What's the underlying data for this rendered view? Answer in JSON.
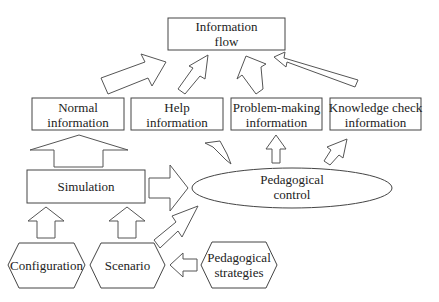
{
  "diagram": {
    "nodes": {
      "information_flow": {
        "line1": "Information",
        "line2": "flow"
      },
      "normal_information": {
        "line1": "Normal",
        "line2": "information"
      },
      "help_information": {
        "line1": "Help",
        "line2": "information"
      },
      "problem_making_information": {
        "line1": "Problem-making",
        "line2": "information"
      },
      "knowledge_check_information": {
        "line1": "Knowledge check",
        "line2": "information"
      },
      "simulation": {
        "label": "Simulation"
      },
      "pedagogical_control": {
        "line1": "Pedagogical",
        "line2": "control"
      },
      "configuration": {
        "label": "Configuration"
      },
      "scenario": {
        "label": "Scenario"
      },
      "pedagogical_strategies": {
        "line1": "Pedagogical",
        "line2": "strategies"
      }
    },
    "edges": [
      {
        "from": "normal_information",
        "to": "information_flow"
      },
      {
        "from": "help_information",
        "to": "information_flow"
      },
      {
        "from": "problem_making_information",
        "to": "information_flow"
      },
      {
        "from": "knowledge_check_information",
        "to": "information_flow"
      },
      {
        "from": "simulation",
        "to": "normal_information"
      },
      {
        "from": "simulation",
        "to": "pedagogical_control"
      },
      {
        "from": "scenario",
        "to": "pedagogical_control"
      },
      {
        "from": "pedagogical_control",
        "to": "help_information"
      },
      {
        "from": "pedagogical_control",
        "to": "problem_making_information"
      },
      {
        "from": "pedagogical_control",
        "to": "knowledge_check_information"
      },
      {
        "from": "configuration",
        "to": "simulation"
      },
      {
        "from": "scenario",
        "to": "simulation"
      },
      {
        "from": "pedagogical_strategies",
        "to": "scenario"
      }
    ]
  }
}
